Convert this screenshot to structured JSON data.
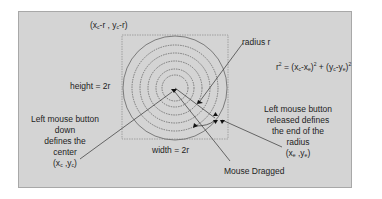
{
  "diagram": {
    "colors": {
      "panel_bg": "#d4d4d4",
      "panel_border": "#a8a8a8",
      "lines": "#333333",
      "circles": "#555555",
      "text": "#1e1e1e"
    },
    "labels": {
      "top_left_corner": "(xc-r , yc-r)",
      "top_left_x": "(x",
      "top_left_xsub": "c",
      "top_left_mid": "-r , y",
      "top_left_ysub": "c",
      "top_left_end": "-r)",
      "height": "height = 2r",
      "width": "width = 2r",
      "radius": "radius r",
      "formula": "r² = (xc-xe)² + (yc-ye)²",
      "formula_parts": {
        "r": "r",
        "eq": " = (x",
        "xc": "c",
        "minus1": "-x",
        "xe": "e",
        "close1": ")",
        "plus": " + (y",
        "yc": "c",
        "minus2": "-y",
        "ye": "e",
        "close2": ")",
        "sq": "2"
      },
      "left_annotation": [
        "Left mouse button",
        "down",
        "defines the",
        "center"
      ],
      "left_coords": {
        "open": "(x",
        "sub1": "c",
        "mid": " ,y",
        "sub2": "c",
        "close": ")"
      },
      "right_annotation": [
        "Left mouse button",
        "released defines",
        "the end of the",
        "radius"
      ],
      "right_coords": {
        "open": "(x",
        "sub1": "e",
        "mid": " ,y",
        "sub2": "e",
        "close": ")"
      },
      "mouse_dragged": "Mouse Dragged"
    }
  }
}
